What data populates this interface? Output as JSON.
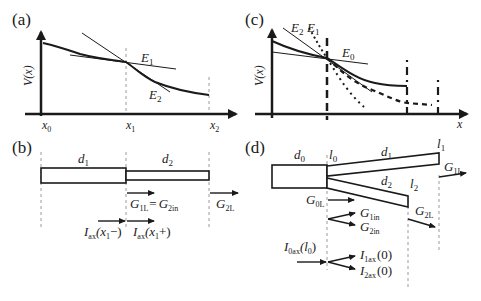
{
  "panels": {
    "a": {
      "label": "(a)",
      "ylabel": "V(x)",
      "x_ticks": [
        "x",
        "x",
        "x"
      ],
      "x_tick_subs": [
        "0",
        "1",
        "2"
      ],
      "tangent_labels": [
        {
          "main": "E",
          "sub": "1"
        },
        {
          "main": "E",
          "sub": "2"
        }
      ]
    },
    "b": {
      "label": "(b)",
      "segments": [
        {
          "main": "d",
          "sub": "1"
        },
        {
          "main": "d",
          "sub": "2"
        }
      ],
      "conductance_eq": {
        "left": "G",
        "left_sub": "1L",
        "eq": "=",
        "right": "G",
        "right_sub": "2in"
      },
      "end_conductance": {
        "main": "G",
        "sub": "2L"
      },
      "currents": [
        {
          "main": "I",
          "sub": "ax",
          "arg": "(x",
          "arg_sub": "1",
          "tail": "−)"
        },
        {
          "main": "I",
          "sub": "ax",
          "arg": "(x",
          "arg_sub": "1",
          "tail": "+)"
        }
      ]
    },
    "c": {
      "label": "(c)",
      "ylabel": "V(x)",
      "xlabel": "x",
      "tangent_labels": [
        {
          "main": "E",
          "sub": "2"
        },
        {
          "main": "E",
          "sub": "1"
        },
        {
          "main": "E",
          "sub": "0"
        }
      ]
    },
    "d": {
      "label": "(d)",
      "segments": [
        {
          "main": "d",
          "sub": "0"
        },
        {
          "main": "d",
          "sub": "1"
        },
        {
          "main": "d",
          "sub": "2"
        }
      ],
      "positions": [
        {
          "main": "l",
          "sub": "0"
        },
        {
          "main": "l",
          "sub": "1"
        },
        {
          "main": "l",
          "sub": "2"
        }
      ],
      "conductances": [
        {
          "main": "G",
          "sub": "0L"
        },
        {
          "main": "G",
          "sub": "1in"
        },
        {
          "main": "G",
          "sub": "2in"
        },
        {
          "main": "G",
          "sub": "1L"
        },
        {
          "main": "G",
          "sub": "2L"
        }
      ],
      "currents": [
        {
          "main": "I",
          "sub": "0ax",
          "arg": "(l",
          "arg_sub": "0",
          "tail": ")"
        },
        {
          "main": "I",
          "sub": "1ax",
          "arg": "(0)"
        },
        {
          "main": "I",
          "sub": "2ax",
          "arg": "(0)"
        }
      ]
    }
  },
  "colors": {
    "ink": "#1a1a1a",
    "guide": "#9a9a9a"
  }
}
